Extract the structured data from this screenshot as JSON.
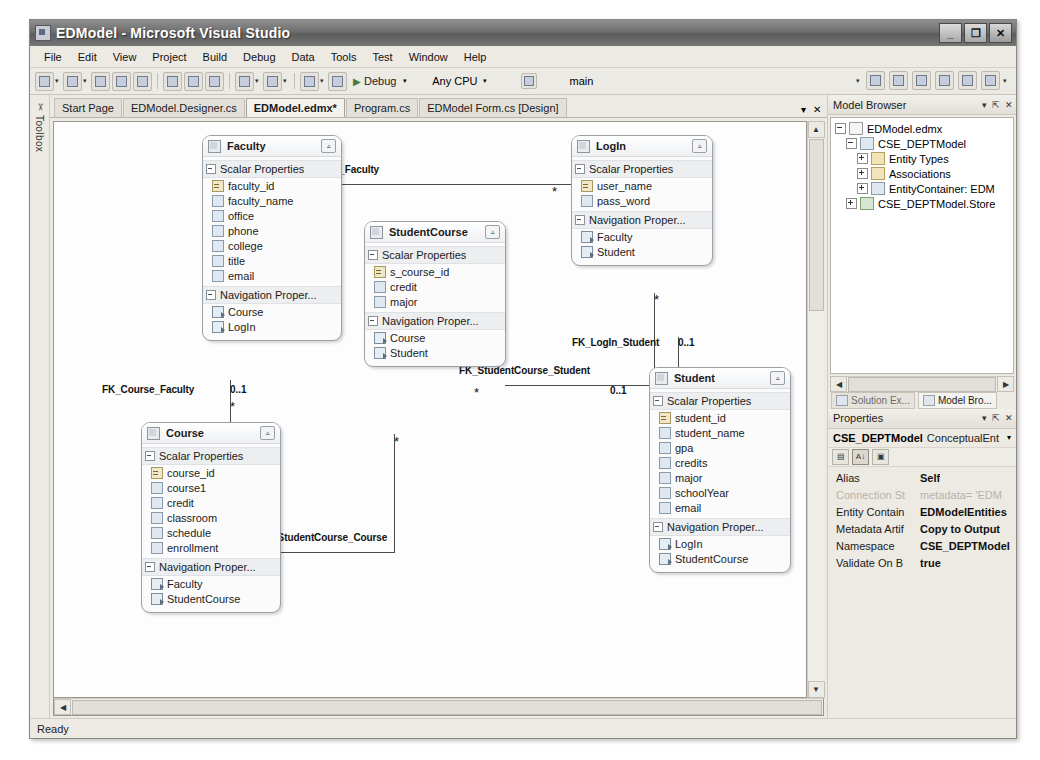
{
  "window": {
    "title": "EDModel - Microsoft Visual Studio",
    "app_icon": "visual-studio-icon",
    "minimize_label": "_",
    "maximize_label": "❐",
    "close_label": "✕"
  },
  "menubar": {
    "items": [
      {
        "label": "File",
        "mnemonic": "F"
      },
      {
        "label": "Edit",
        "mnemonic": "E"
      },
      {
        "label": "View",
        "mnemonic": "V"
      },
      {
        "label": "Project",
        "mnemonic": "P"
      },
      {
        "label": "Build",
        "mnemonic": "B"
      },
      {
        "label": "Debug",
        "mnemonic": "D"
      },
      {
        "label": "Data",
        "mnemonic": "a"
      },
      {
        "label": "Tools",
        "mnemonic": "T"
      },
      {
        "label": "Test",
        "mnemonic": "s"
      },
      {
        "label": "Window",
        "mnemonic": "W"
      },
      {
        "label": "Help",
        "mnemonic": "H"
      }
    ]
  },
  "toolbar": {
    "start_label": "Debug",
    "platform_label": "Any CPU",
    "config_label": "main",
    "run_icon": "play-icon",
    "buttons": [
      "new-project-icon",
      "add-new-item-icon",
      "open-file-icon",
      "save-icon",
      "save-all-icon",
      "cut-icon",
      "copy-icon",
      "paste-icon",
      "undo-icon",
      "redo-icon",
      "navigate-back-icon",
      "navigate-forward-icon"
    ],
    "right_buttons": [
      "solution-explorer-icon",
      "properties-window-icon",
      "object-browser-icon",
      "toolbox-icon",
      "error-list-icon",
      "output-window-icon"
    ]
  },
  "toolbox": {
    "label": "Toolbox",
    "icon": "toolbox-icon"
  },
  "doctabs": {
    "tabs": [
      {
        "label": "Start Page",
        "active": false
      },
      {
        "label": "EDModel.Designer.cs",
        "active": false
      },
      {
        "label": "EDModel.edmx*",
        "active": true
      },
      {
        "label": "Program.cs",
        "active": false
      },
      {
        "label": "EDModel Form.cs [Design]",
        "active": false
      }
    ],
    "dropdown_icon": "chevron-down-icon",
    "close_icon": "close-icon"
  },
  "diagram": {
    "entities": [
      {
        "name": "Faculty",
        "x": 148,
        "y": 13,
        "width": 138,
        "scalar_label": "Scalar Properties",
        "nav_label": "Navigation  Proper...",
        "scalars": [
          {
            "name": "faculty_id",
            "key": true
          },
          {
            "name": "faculty_name",
            "key": false
          },
          {
            "name": "office",
            "key": false
          },
          {
            "name": "phone",
            "key": false
          },
          {
            "name": "college",
            "key": false
          },
          {
            "name": "title",
            "key": false
          },
          {
            "name": "email",
            "key": false
          }
        ],
        "navigations": [
          "Course",
          "LogIn"
        ]
      },
      {
        "name": "LogIn",
        "x": 517,
        "y": 13,
        "width": 140,
        "scalar_label": "Scalar Properties",
        "nav_label": "Navigation  Proper...",
        "scalars": [
          {
            "name": "user_name",
            "key": true
          },
          {
            "name": "pass_word",
            "key": false
          }
        ],
        "navigations": [
          "Faculty",
          "Student"
        ]
      },
      {
        "name": "StudentCourse",
        "x": 310,
        "y": 99,
        "width": 140,
        "scalar_label": "Scalar Properties",
        "nav_label": "Navigation  Proper...",
        "scalars": [
          {
            "name": "s_course_id",
            "key": true
          },
          {
            "name": "credit",
            "key": false
          },
          {
            "name": "major",
            "key": false
          }
        ],
        "navigations": [
          "Course",
          "Student"
        ]
      },
      {
        "name": "Course",
        "x": 87,
        "y": 300,
        "width": 138,
        "scalar_label": "Scalar Properties",
        "nav_label": "Navigation  Proper...",
        "scalars": [
          {
            "name": "course_id",
            "key": true
          },
          {
            "name": "course1",
            "key": false
          },
          {
            "name": "credit",
            "key": false
          },
          {
            "name": "classroom",
            "key": false
          },
          {
            "name": "schedule",
            "key": false
          },
          {
            "name": "enrollment",
            "key": false
          }
        ],
        "navigations": [
          "Faculty",
          "StudentCourse"
        ]
      },
      {
        "name": "Student",
        "x": 595,
        "y": 245,
        "width": 140,
        "scalar_label": "Scalar Properties",
        "nav_label": "Navigation  Proper...",
        "scalars": [
          {
            "name": "student_id",
            "key": true
          },
          {
            "name": "student_name",
            "key": false
          },
          {
            "name": "gpa",
            "key": false
          },
          {
            "name": "credits",
            "key": false
          },
          {
            "name": "major",
            "key": false
          },
          {
            "name": "schoolYear",
            "key": false
          },
          {
            "name": "email",
            "key": false
          }
        ],
        "navigations": [
          "LogIn",
          "StudentCourse"
        ]
      }
    ],
    "associations": [
      {
        "name": "FK_LogIn_Faculty",
        "label_x": 240,
        "label_y": 42,
        "from_card": "0..1",
        "from_x": 240,
        "from_y": 62,
        "to_card": "*",
        "to_x": 498,
        "to_y": 62
      },
      {
        "name": "FK_Course_Faculty",
        "label_x": 48,
        "label_y": 262,
        "from_card": "0..1",
        "from_x": 176,
        "from_y": 262,
        "to_card": "*",
        "to_x": 176,
        "to_y": 277
      },
      {
        "name": "FK_LogIn_Student",
        "label_x": 518,
        "label_y": 215,
        "from_card": "*",
        "from_x": 600,
        "from_y": 170,
        "to_card": "0..1",
        "to_x": 624,
        "to_y": 215
      },
      {
        "name": "FK_StudentCourse_Student",
        "label_x": 405,
        "label_y": 243,
        "from_card": "*",
        "from_x": 420,
        "from_y": 263,
        "to_card": "0..1",
        "to_x": 556,
        "to_y": 263
      },
      {
        "name": "FK_StudentCourse_Course",
        "label_x": 205,
        "label_y": 410,
        "from_card": "0..1",
        "from_x": 205,
        "from_y": 430,
        "to_card": "*",
        "to_x": 340,
        "to_y": 312
      }
    ]
  },
  "model_browser": {
    "title": "Model Browser",
    "dropdown_icon": "chevron-down-icon",
    "pin_icon": "pin-icon",
    "close_icon": "close-icon",
    "nodes": [
      {
        "label": "EDModel.edmx",
        "indent": 0,
        "expander": "minus",
        "icon": "document-icon"
      },
      {
        "label": "CSE_DEPTModel",
        "indent": 1,
        "expander": "minus",
        "icon": "model-icon"
      },
      {
        "label": "Entity Types",
        "indent": 2,
        "expander": "plus",
        "icon": "folder-icon"
      },
      {
        "label": "Associations",
        "indent": 2,
        "expander": "plus",
        "icon": "folder-icon"
      },
      {
        "label": "EntityContainer: EDM",
        "indent": 2,
        "expander": "plus",
        "icon": "container-icon"
      },
      {
        "label": "CSE_DEPTModel.Store",
        "indent": 1,
        "expander": "plus",
        "icon": "database-icon"
      }
    ],
    "scroll_left_icon": "chevron-left-icon",
    "scroll_right_icon": "chevron-right-icon"
  },
  "dock_tabs": [
    {
      "label": "Solution Ex...",
      "icon": "solution-explorer-icon",
      "active": false
    },
    {
      "label": "Model Bro...",
      "icon": "model-browser-icon",
      "active": true
    }
  ],
  "properties": {
    "title": "Properties",
    "dropdown_icon": "chevron-down-icon",
    "pin_icon": "pin-icon",
    "close_icon": "close-icon",
    "object_name": "CSE_DEPTModel",
    "object_type": "ConceptualEnt",
    "object_caret": "▾",
    "toolbar_buttons": [
      "categorized-icon",
      "alphabetical-icon",
      "property-pages-icon"
    ],
    "rows": [
      {
        "name": "Alias",
        "value": "Self",
        "dim": false
      },
      {
        "name": "Connection St",
        "value": "metadata= 'EDM",
        "dim": true
      },
      {
        "name": "Entity Contain",
        "value": "EDModelEntities",
        "dim": false
      },
      {
        "name": "Metadata Artif",
        "value": "Copy to Output",
        "dim": false
      },
      {
        "name": "Namespace",
        "value": "CSE_DEPTModel",
        "dim": false
      },
      {
        "name": "Validate On B",
        "value": "true",
        "dim": false
      }
    ]
  },
  "statusbar": {
    "text": "Ready"
  }
}
